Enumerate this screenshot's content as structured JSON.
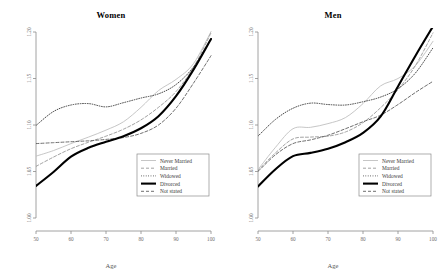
{
  "figure": {
    "panels": [
      {
        "key": "women",
        "title": "Women",
        "xlabel": "Age"
      },
      {
        "key": "men",
        "title": "Men",
        "xlabel": "Age"
      }
    ],
    "legend": {
      "entries": [
        {
          "label": "Never Married",
          "style": "solid-gray",
          "color": "#bfbfbf",
          "width": 0.9
        },
        {
          "label": "Married",
          "style": "dashed-gray",
          "color": "#8a8a8a",
          "width": 0.8
        },
        {
          "label": "Widowed",
          "style": "dotted",
          "color": "#1a1a1a",
          "width": 0.8
        },
        {
          "label": "Divorced",
          "style": "solid-thick",
          "color": "#000000",
          "width": 2.1
        },
        {
          "label": "Not stated",
          "style": "dashed",
          "color": "#4a4a4a",
          "width": 0.8
        }
      ]
    }
  },
  "chart_data": [
    {
      "type": "line",
      "title": "Women",
      "xlabel": "Age",
      "ylabel": "",
      "xlim": [
        50,
        100
      ],
      "ylim": [
        1.0,
        1.2
      ],
      "xticks": [
        50,
        60,
        70,
        80,
        90,
        100
      ],
      "yticks": [
        1.0,
        1.05,
        1.1,
        1.15,
        1.2
      ],
      "ytick_labels": [
        "1.00",
        "1.05",
        "1.10",
        "1.15",
        "1.20"
      ],
      "xtick_labels": [
        "50",
        "60",
        "70",
        "80",
        "90",
        "100"
      ],
      "grid": false,
      "legend_position": "bottom-right",
      "x": [
        50,
        55,
        60,
        65,
        70,
        75,
        80,
        85,
        90,
        95,
        100
      ],
      "series": [
        {
          "name": "Never Married",
          "values": [
            1.0665,
            1.0725,
            1.08,
            1.087,
            1.0945,
            1.1035,
            1.119,
            1.137,
            1.149,
            1.166,
            1.2005
          ]
        },
        {
          "name": "Married",
          "values": [
            1.0555,
            1.0655,
            1.0745,
            1.0815,
            1.088,
            1.0955,
            1.1055,
            1.119,
            1.136,
            1.162,
            1.199
          ]
        },
        {
          "name": "Widowed",
          "values": [
            1.0995,
            1.1145,
            1.1215,
            1.123,
            1.1195,
            1.124,
            1.129,
            1.1335,
            1.1435,
            1.1625,
            1.193
          ]
        },
        {
          "name": "Divorced",
          "values": [
            1.0345,
            1.0495,
            1.066,
            1.0755,
            1.082,
            1.088,
            1.0965,
            1.1095,
            1.131,
            1.1595,
            1.1925
          ]
        },
        {
          "name": "Not stated",
          "values": [
            1.08,
            1.081,
            1.082,
            1.083,
            1.0845,
            1.0865,
            1.091,
            1.1,
            1.118,
            1.145,
            1.1745
          ]
        }
      ]
    },
    {
      "type": "line",
      "title": "Men",
      "xlabel": "Age",
      "ylabel": "",
      "xlim": [
        50,
        100
      ],
      "ylim": [
        1.0,
        1.2
      ],
      "xticks": [
        50,
        60,
        70,
        80,
        90,
        100
      ],
      "yticks": [
        1.0,
        1.05,
        1.1,
        1.15,
        1.2
      ],
      "ytick_labels": [
        "1.00",
        "1.05",
        "1.10",
        "1.15",
        "1.20"
      ],
      "xtick_labels": [
        "50",
        "60",
        "70",
        "80",
        "90",
        "100"
      ],
      "grid": false,
      "legend_position": "bottom-right",
      "x": [
        50,
        55,
        60,
        65,
        70,
        75,
        80,
        85,
        90,
        95,
        100
      ],
      "series": [
        {
          "name": "Never Married",
          "values": [
            1.052,
            1.076,
            1.096,
            1.0975,
            1.1015,
            1.108,
            1.123,
            1.142,
            1.15,
            1.164,
            1.19
          ]
        },
        {
          "name": "Married",
          "values": [
            1.051,
            1.07,
            1.085,
            1.087,
            1.088,
            1.0925,
            1.1025,
            1.1185,
            1.138,
            1.164,
            1.199
          ]
        },
        {
          "name": "Widowed",
          "values": [
            1.088,
            1.106,
            1.118,
            1.1235,
            1.122,
            1.1215,
            1.125,
            1.13,
            1.139,
            1.156,
            1.183
          ]
        },
        {
          "name": "Divorced",
          "values": [
            1.034,
            1.0525,
            1.0665,
            1.07,
            1.0745,
            1.0815,
            1.0915,
            1.109,
            1.1415,
            1.1745,
            1.206
          ]
        },
        {
          "name": "Not stated",
          "values": [
            1.05,
            1.068,
            1.08,
            1.084,
            1.089,
            1.096,
            1.1035,
            1.1105,
            1.122,
            1.135,
            1.147
          ]
        }
      ]
    }
  ]
}
